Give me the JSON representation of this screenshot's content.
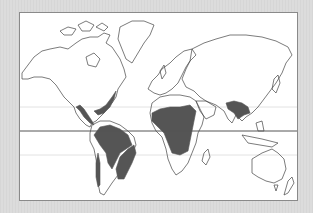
{
  "map": {
    "type": "world-outline",
    "projection": "equirectangular-like",
    "colors": {
      "background": "#d9d9d9",
      "frame": "#ffffff",
      "border": "#8a8a8a",
      "coastline": "#444444",
      "shaded_region": "#555555",
      "equator": "#555555",
      "tropic_lines": "#e0e0e0"
    },
    "reference_lines": [
      {
        "name": "tropic-of-cancer",
        "style": "faint"
      },
      {
        "name": "equator",
        "style": "solid"
      },
      {
        "name": "tropic-of-capricorn",
        "style": "faint"
      }
    ],
    "shaded_regions": [
      "central-america-mexico-gulf-coast",
      "northern-south-america-amazon",
      "eastern-brazil",
      "western-andes-strip",
      "sub-saharan-africa",
      "india-south-asia"
    ]
  }
}
